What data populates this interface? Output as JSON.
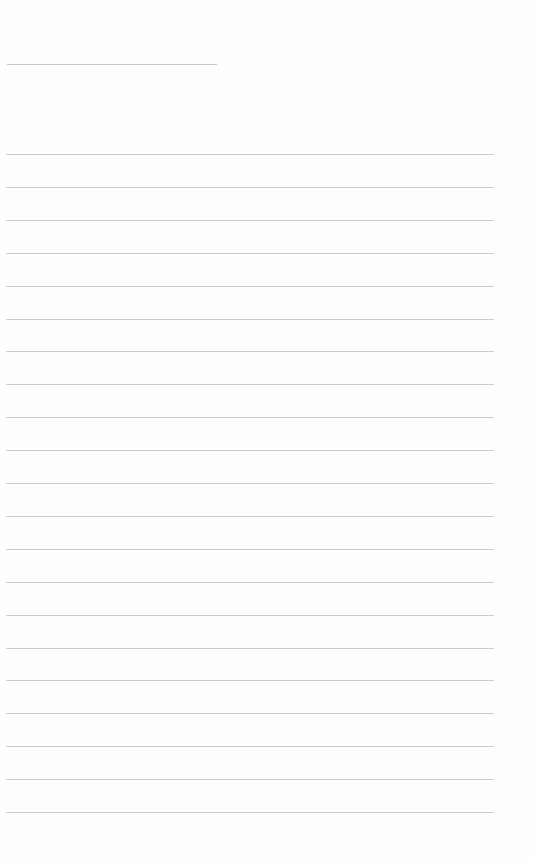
{
  "page": {
    "type": "blank-lined-sheet",
    "title_line": {
      "top": 64,
      "left": 7,
      "width": 210
    },
    "rules": {
      "count": 21,
      "first_top": 154,
      "spacing": 32.9,
      "left": 6,
      "width": 488
    },
    "line_color": "#cdcdcd",
    "background": "#fefefe"
  }
}
